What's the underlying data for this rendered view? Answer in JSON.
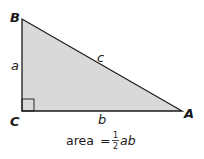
{
  "diagram": {
    "type": "right-triangle",
    "vertices": {
      "B": {
        "label": "B"
      },
      "C": {
        "label": "C"
      },
      "A": {
        "label": "A"
      }
    },
    "sides": {
      "a": {
        "label": "a",
        "between": "B-C"
      },
      "b": {
        "label": "b",
        "between": "C-A"
      },
      "c": {
        "label": "c",
        "between": "B-A"
      }
    },
    "right_angle_at": "C",
    "formula": {
      "prefix": "area",
      "equals": "=",
      "frac_num": "1",
      "frac_den": "2",
      "suffix": "ab"
    },
    "colors": {
      "fill": "#d9d9d9",
      "stroke": "#1a1a1a"
    }
  }
}
